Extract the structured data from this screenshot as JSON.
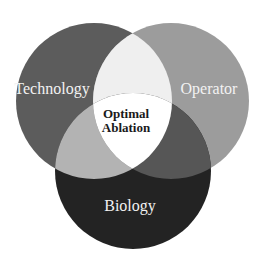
{
  "diagram": {
    "type": "venn",
    "sets": [
      {
        "id": "technology",
        "label": "Technology",
        "cx": 94,
        "cy": 101,
        "r": 78,
        "color": "#5c5c5c"
      },
      {
        "id": "operator",
        "label": "Operator",
        "cx": 171,
        "cy": 101,
        "r": 78,
        "color": "#9c9c9c"
      },
      {
        "id": "biology",
        "label": "Biology",
        "cx": 133,
        "cy": 171,
        "r": 78,
        "color": "#232323"
      }
    ],
    "overlaps": {
      "technology_operator": "#efefef",
      "technology_biology": "#b3b3b3",
      "operator_biology": "#565656",
      "all": "#ffffff"
    },
    "center_label": {
      "line1": "Optimal",
      "line2": "Ablation",
      "color": "#1a1a1a"
    }
  }
}
